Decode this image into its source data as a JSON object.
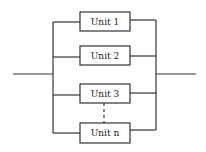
{
  "diagram": {
    "type": "parallel-system-block-diagram",
    "units": [
      {
        "label": "Unit 1"
      },
      {
        "label": "Unit 2"
      },
      {
        "label": "Unit 3"
      },
      {
        "label": "Unit n"
      }
    ],
    "ellipsis_between": [
      "Unit 3",
      "Unit n"
    ]
  }
}
